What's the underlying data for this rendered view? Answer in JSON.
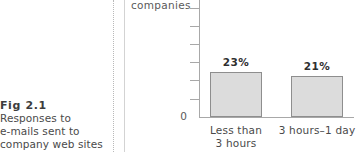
{
  "figure": {
    "caption_title": "Fig 2.1",
    "caption_lines": [
      "Responses to",
      "e-mails sent to",
      "company web sites"
    ]
  },
  "colors": {
    "bar_fill": "#dcdcdc",
    "bar_border": "#8e8e8e",
    "axis": "#a8a8a8",
    "text": "#4a4a4a",
    "rule_dotted": "#b9b9b9",
    "rule_solid": "#d3d3d3"
  },
  "chart_data": {
    "type": "bar",
    "title": "",
    "subtitle": "",
    "xlabel": "",
    "ylabel": "companies",
    "categories": [
      "Less than 3 hours",
      "3 hours–1 day"
    ],
    "category_lines": [
      [
        "Less than",
        "3 hours"
      ],
      [
        "3 hours–1 day"
      ]
    ],
    "values": [
      23,
      21
    ],
    "data_labels": [
      "23%",
      "21%"
    ],
    "ylim": [
      0,
      60
    ],
    "yticks": [
      0,
      10,
      20,
      30,
      40,
      50,
      60
    ],
    "ytick_labels": [
      "0",
      "",
      "",
      "",
      "",
      "",
      ""
    ],
    "grid": false,
    "legend": false
  }
}
